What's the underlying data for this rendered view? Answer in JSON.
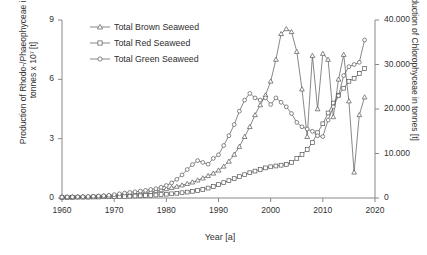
{
  "chart_data": {
    "type": "line",
    "title": "",
    "xlabel": "Year [a]",
    "ylabel_left": "Production of Rhodo-/Phaeophyceae in tonnes x 10⁷ [t]",
    "ylabel_right": "Production of Chlorophyceae in tonnes [t]",
    "xlim": [
      1960,
      2020
    ],
    "ylim_left": [
      0,
      9
    ],
    "ylim_right": [
      0,
      40000
    ],
    "grid": false,
    "legend_position": "top-left",
    "xticks": [
      "1960",
      "1970",
      "1980",
      "1990",
      "2000",
      "2010",
      "2020"
    ],
    "xtick_values": [
      1960,
      1970,
      1980,
      1990,
      2000,
      2010,
      2020
    ],
    "yticks_left": [
      "0",
      "3",
      "6",
      "9"
    ],
    "ytick_values_left": [
      0,
      3,
      6,
      9
    ],
    "yticks_right": [
      "0",
      "10.000",
      "20.000",
      "30.000",
      "40.000"
    ],
    "ytick_values_right": [
      0,
      10000,
      20000,
      30000,
      40000
    ],
    "series": [
      {
        "name": "Total Brown Seaweed",
        "marker": "triangle",
        "axis": "left",
        "color": "#555555",
        "x": [
          1960,
          1961,
          1962,
          1963,
          1964,
          1965,
          1966,
          1967,
          1968,
          1969,
          1970,
          1971,
          1972,
          1973,
          1974,
          1975,
          1976,
          1977,
          1978,
          1979,
          1980,
          1981,
          1982,
          1983,
          1984,
          1985,
          1986,
          1987,
          1988,
          1989,
          1990,
          1991,
          1992,
          1993,
          1994,
          1995,
          1996,
          1997,
          1998,
          1999,
          2000,
          2001,
          2002,
          2003,
          2004,
          2005,
          2006,
          2007,
          2008,
          2009,
          2010,
          2011,
          2012,
          2013,
          2014,
          2015,
          2016,
          2017,
          2018
        ],
        "values": [
          0.05,
          0.05,
          0.06,
          0.06,
          0.07,
          0.07,
          0.08,
          0.09,
          0.1,
          0.11,
          0.12,
          0.14,
          0.16,
          0.18,
          0.21,
          0.24,
          0.28,
          0.32,
          0.36,
          0.41,
          0.46,
          0.52,
          0.58,
          0.65,
          0.72,
          0.8,
          0.9,
          1.0,
          1.12,
          1.25,
          1.4,
          1.6,
          1.85,
          2.2,
          2.6,
          3.1,
          3.6,
          4.2,
          4.7,
          5.2,
          5.9,
          7.0,
          8.3,
          8.55,
          8.4,
          7.4,
          5.5,
          3.1,
          7.2,
          4.5,
          7.3,
          7.0,
          4.1,
          6.0,
          7.25,
          4.9,
          1.3,
          4.2,
          5.1
        ]
      },
      {
        "name": "Total Red Seaweed",
        "marker": "square",
        "axis": "left",
        "color": "#555555",
        "x": [
          1960,
          1961,
          1962,
          1963,
          1964,
          1965,
          1966,
          1967,
          1968,
          1969,
          1970,
          1971,
          1972,
          1973,
          1974,
          1975,
          1976,
          1977,
          1978,
          1979,
          1980,
          1981,
          1982,
          1983,
          1984,
          1985,
          1986,
          1987,
          1988,
          1989,
          1990,
          1991,
          1992,
          1993,
          1994,
          1995,
          1996,
          1997,
          1998,
          1999,
          2000,
          2001,
          2002,
          2003,
          2004,
          2005,
          2006,
          2007,
          2008,
          2009,
          2010,
          2011,
          2012,
          2013,
          2014,
          2015,
          2016,
          2017,
          2018
        ],
        "values": [
          0.03,
          0.03,
          0.03,
          0.04,
          0.04,
          0.04,
          0.05,
          0.05,
          0.06,
          0.06,
          0.07,
          0.08,
          0.08,
          0.09,
          0.1,
          0.11,
          0.12,
          0.13,
          0.15,
          0.17,
          0.19,
          0.21,
          0.24,
          0.27,
          0.3,
          0.34,
          0.38,
          0.43,
          0.5,
          0.58,
          0.68,
          0.78,
          0.88,
          0.98,
          1.08,
          1.18,
          1.28,
          1.36,
          1.44,
          1.52,
          1.58,
          1.62,
          1.66,
          1.7,
          1.8,
          2.0,
          2.2,
          2.45,
          2.8,
          3.3,
          3.75,
          4.3,
          4.8,
          5.2,
          5.55,
          5.9,
          6.05,
          6.3,
          6.55
        ]
      },
      {
        "name": "Total Green Seaweed",
        "marker": "circle",
        "axis": "right",
        "color": "#555555",
        "x": [
          1960,
          1961,
          1962,
          1963,
          1964,
          1965,
          1966,
          1967,
          1968,
          1969,
          1970,
          1971,
          1972,
          1973,
          1974,
          1975,
          1976,
          1977,
          1978,
          1979,
          1980,
          1981,
          1982,
          1983,
          1984,
          1985,
          1986,
          1987,
          1988,
          1989,
          1990,
          1991,
          1992,
          1993,
          1994,
          1995,
          1996,
          1997,
          1998,
          1999,
          2000,
          2001,
          2002,
          2003,
          2004,
          2005,
          2006,
          2007,
          2008,
          2009,
          2010,
          2011,
          2012,
          2013,
          2014,
          2015,
          2016,
          2017,
          2018
        ],
        "values": [
          200,
          220,
          240,
          260,
          300,
          340,
          380,
          430,
          500,
          600,
          750,
          950,
          1100,
          1250,
          1400,
          1550,
          1700,
          1900,
          2100,
          2400,
          2800,
          3400,
          4200,
          5200,
          6400,
          7500,
          8400,
          8000,
          7600,
          8900,
          9700,
          11800,
          14000,
          16500,
          19500,
          22000,
          23500,
          22500,
          22000,
          22500,
          21000,
          22500,
          21500,
          20500,
          19000,
          17000,
          16000,
          15500,
          15000,
          14000,
          13800,
          17500,
          20500,
          23000,
          27500,
          29500,
          30000,
          30500,
          35500
        ]
      }
    ]
  },
  "legend": {
    "items": [
      {
        "label": "Total Brown Seaweed"
      },
      {
        "label": "Total Red Seaweed"
      },
      {
        "label": "Total Green Seaweed"
      }
    ]
  }
}
